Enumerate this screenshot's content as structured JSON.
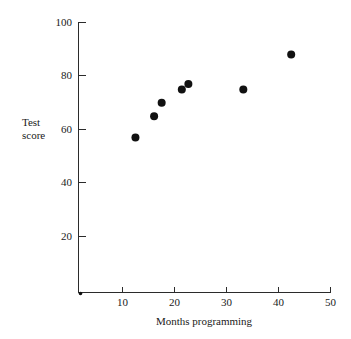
{
  "chart_data": {
    "type": "scatter",
    "title": "",
    "xlabel": "Months programming",
    "ylabel": "Test score",
    "ylabel_lines": [
      "Test",
      "score"
    ],
    "xlim": [
      0,
      50
    ],
    "ylim": [
      0,
      100
    ],
    "xticks": [
      10,
      20,
      30,
      40,
      50
    ],
    "yticks": [
      20,
      40,
      60,
      80,
      100
    ],
    "xtick_labels": [
      "10",
      "20",
      "30",
      "40",
      "50"
    ],
    "ytick_labels": [
      "20",
      "40",
      "60",
      "80",
      "100"
    ],
    "grid": false,
    "legend": null,
    "point_color": "#111111",
    "axis_color": "#2b2b2b",
    "points": [
      {
        "x": 11.3,
        "y": 57
      },
      {
        "x": 15.0,
        "y": 65
      },
      {
        "x": 16.5,
        "y": 70
      },
      {
        "x": 20.5,
        "y": 75
      },
      {
        "x": 21.8,
        "y": 77
      },
      {
        "x": 32.7,
        "y": 75
      },
      {
        "x": 42.2,
        "y": 88
      }
    ],
    "x": [
      11.3,
      15.0,
      16.5,
      20.5,
      21.8,
      32.7,
      42.2
    ],
    "y": [
      57,
      65,
      70,
      75,
      77,
      75,
      88
    ]
  }
}
